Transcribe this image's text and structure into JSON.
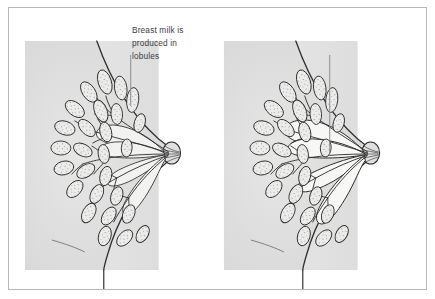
{
  "figure": {
    "type": "anatomical-illustration",
    "view": "sagittal / side cross-section",
    "panel_count": 2,
    "style": "pencil line drawing with gray wash shading and stippled lobules"
  },
  "frame": {
    "border_color": "#b9b9bc",
    "background": "#ffffff"
  },
  "colors": {
    "body_fill": "#e2e2e2",
    "body_fill_edge": "#d8d8d8",
    "outline": "#2b2b2b",
    "duct_fill": "#f2f2f0",
    "lobule_fill": "#ececeb",
    "stipple": "#6d6d6d",
    "text": "#3b3d44",
    "leader_line": "#8d8d92"
  },
  "panels": [
    {
      "id": "left",
      "data_name": "panel-lobules",
      "label": {
        "text": "Breast milk is\nproduced in\nlobules",
        "lines": [
          "Breast milk is",
          "produced in",
          "lobules"
        ],
        "leader_target": "lobule-cluster"
      },
      "structures": [
        "chest wall",
        "breast contour",
        "nipple",
        "lobules",
        "ducts"
      ],
      "emphasis": "lobules"
    },
    {
      "id": "right",
      "data_name": "panel-ducts",
      "label": {
        "text": "Ducts collect\nmilk and carry it\nto the nipple",
        "lines": [
          "Ducts collect",
          "milk and carry it",
          "to the nipple"
        ],
        "leader_target": "lactiferous-duct"
      },
      "structures": [
        "chest wall",
        "breast contour",
        "nipple",
        "lobules",
        "ducts",
        "lactiferous sinuses"
      ],
      "emphasis": "ducts"
    }
  ]
}
